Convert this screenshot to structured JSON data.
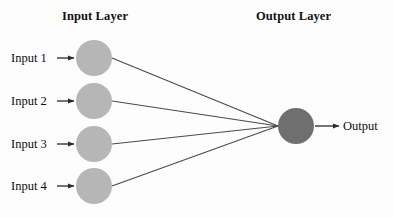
{
  "diagram": {
    "kind": "neural-network-diagram",
    "background_color": "#fdfdfd",
    "titles": {
      "input_layer": "Input Layer",
      "output_layer": "Output Layer"
    },
    "input_nodes": [
      {
        "label": "Input 1",
        "cx": 94,
        "cy": 58,
        "r": 18
      },
      {
        "label": "Input 2",
        "cx": 94,
        "cy": 101,
        "r": 18
      },
      {
        "label": "Input 3",
        "cx": 94,
        "cy": 144,
        "r": 18
      },
      {
        "label": "Input 4",
        "cx": 94,
        "cy": 186,
        "r": 18
      }
    ],
    "output_node": {
      "label": "Output",
      "cx": 296,
      "cy": 126,
      "r": 18
    },
    "colors": {
      "input_node_fill": "#b6b6b6",
      "output_node_fill": "#6f6f6f",
      "edge_stroke": "#4a4a4a",
      "arrow_stroke": "#2b2b2b",
      "title_text": "#121212",
      "label_text": "#0e0e0e"
    },
    "edges": [
      {
        "from": "Input 1",
        "to": "Output"
      },
      {
        "from": "Input 2",
        "to": "Output"
      },
      {
        "from": "Input 3",
        "to": "Output"
      },
      {
        "from": "Input 4",
        "to": "Output"
      }
    ],
    "arrows": {
      "input_arrow_start_x": 57,
      "input_arrow_end_x": 75,
      "output_arrow_start_x": 315,
      "output_arrow_end_x": 340
    }
  }
}
